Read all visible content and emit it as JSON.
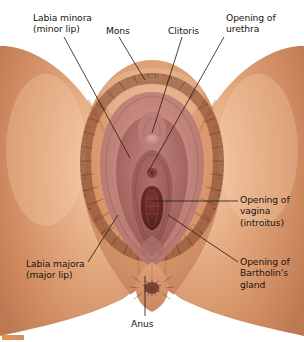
{
  "figure": {
    "background_color": "#ffffff",
    "text_color": "#1a1410",
    "leader_line_color": "#2b2118",
    "width": 304,
    "height": 342
  },
  "palette": {
    "skin_light": "#f0c3a4",
    "skin_mid": "#dfa077",
    "skin_deep": "#c9825c",
    "skin_shadow": "#b4704c",
    "thigh_edge": "#d9996f",
    "labia_pink": "#c98a86",
    "labia_mid": "#b9706c",
    "labia_deep": "#9d5a57",
    "mucosa": "#a85f5c",
    "introitus_dark": "#6d2f2c",
    "hair_dark": "#6b3a28",
    "hair_mid": "#8d4f34",
    "anus_dark": "#7a4432",
    "corner_mark": "#e8893f"
  },
  "labels": [
    {
      "id": "labia-minora",
      "lines": [
        "Labia minora",
        "(minor lip)"
      ],
      "text_x": 33,
      "text_y": 12,
      "leader": {
        "x1": 64,
        "y1": 37,
        "x2": 130,
        "y2": 158
      }
    },
    {
      "id": "mons",
      "lines": [
        "Mons"
      ],
      "text_x": 106,
      "text_y": 25,
      "leader": {
        "x1": 119,
        "y1": 37,
        "x2": 145,
        "y2": 80
      }
    },
    {
      "id": "clitoris",
      "lines": [
        "Clitoris"
      ],
      "text_x": 168,
      "text_y": 25,
      "leader": {
        "x1": 182,
        "y1": 37,
        "x2": 152,
        "y2": 133
      }
    },
    {
      "id": "opening-of-urethra",
      "lines": [
        "Opening of",
        "urethra"
      ],
      "text_x": 226,
      "text_y": 12,
      "leader": {
        "x1": 224,
        "y1": 37,
        "x2": 148,
        "y2": 172
      }
    },
    {
      "id": "opening-of-vagina",
      "lines": [
        "Opening of",
        "vagina",
        "(introitus)"
      ],
      "text_x": 240,
      "text_y": 194,
      "leader": {
        "x1": 238,
        "y1": 201,
        "x2": 151,
        "y2": 201
      }
    },
    {
      "id": "opening-of-bartholins-gland",
      "lines": [
        "Opening of",
        "Bartholin's",
        "gland"
      ],
      "text_x": 240,
      "text_y": 256,
      "leader": {
        "x1": 238,
        "y1": 262,
        "x2": 168,
        "y2": 215
      }
    },
    {
      "id": "labia-majora",
      "lines": [
        "Labia majora",
        "(major lip)"
      ],
      "text_x": 26,
      "text_y": 258,
      "leader": {
        "x1": 88,
        "y1": 262,
        "x2": 118,
        "y2": 215
      }
    },
    {
      "id": "anus",
      "lines": [
        "Anus"
      ],
      "text_x": 131,
      "text_y": 318,
      "leader": {
        "x1": 145,
        "y1": 316,
        "x2": 145,
        "y2": 276
      }
    }
  ]
}
